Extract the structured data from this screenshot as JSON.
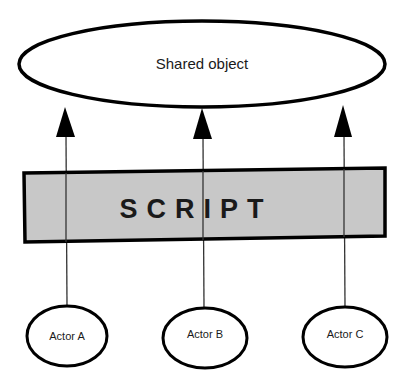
{
  "shared_object": {
    "label": "Shared object"
  },
  "script": {
    "label": "SCRIPT",
    "fill": "#c8c8c8"
  },
  "actors": [
    {
      "label": "Actor A"
    },
    {
      "label": "Actor B"
    },
    {
      "label": "Actor C"
    }
  ],
  "colors": {
    "stroke": "#000000",
    "line": "#333333",
    "text": "#1a1a1a",
    "background": "#ffffff"
  }
}
